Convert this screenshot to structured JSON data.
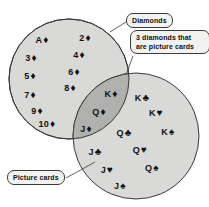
{
  "figure": {
    "type": "venn-diagram",
    "background_color": "#ffffff"
  },
  "colors": {
    "circle_fill": "#d9d9d7",
    "intersection_fill": "#b0b0ae",
    "outline": "#3a3a3a",
    "text": "#111111",
    "callout_fill": "#f2f2f0"
  },
  "sets": {
    "left": {
      "name": "Diamonds",
      "cx": 69,
      "cy": 79,
      "r": 60
    },
    "right": {
      "name": "Picture cards",
      "cx": 136,
      "cy": 136,
      "r": 63
    }
  },
  "callouts": [
    {
      "id": "diamonds",
      "text": "Diamonds",
      "x": 126,
      "y": 13,
      "leader_to_x": 113,
      "leader_to_y": 31
    },
    {
      "id": "intersection",
      "text": "3 diamonds that\nare picture cards",
      "x": 130,
      "y": 30,
      "leader_to_x": 128,
      "leader_to_y": 76
    },
    {
      "id": "picture-cards",
      "text": "Picture cards",
      "x": 7,
      "y": 170,
      "leader_to_x": 95,
      "leader_to_y": 160
    }
  ],
  "cards": {
    "left_only": [
      {
        "rank": "A",
        "suit": "♦",
        "x": 42,
        "y": 40
      },
      {
        "rank": "2",
        "suit": "♦",
        "x": 85,
        "y": 38
      },
      {
        "rank": "3",
        "suit": "♦",
        "x": 31,
        "y": 58
      },
      {
        "rank": "4",
        "suit": "♦",
        "x": 79,
        "y": 55
      },
      {
        "rank": "5",
        "suit": "♦",
        "x": 30,
        "y": 76
      },
      {
        "rank": "6",
        "suit": "♦",
        "x": 74,
        "y": 72
      },
      {
        "rank": "7",
        "suit": "♦",
        "x": 30,
        "y": 95
      },
      {
        "rank": "8",
        "suit": "♦",
        "x": 70,
        "y": 88
      },
      {
        "rank": "9",
        "suit": "♦",
        "x": 37,
        "y": 111
      },
      {
        "rank": "10",
        "suit": "♦",
        "x": 47,
        "y": 124
      }
    ],
    "intersection": [
      {
        "rank": "K",
        "suit": "♦",
        "x": 111,
        "y": 94
      },
      {
        "rank": "Q",
        "suit": "♦",
        "x": 99,
        "y": 112
      },
      {
        "rank": "J",
        "suit": "♦",
        "x": 86,
        "y": 129
      }
    ],
    "right_only": [
      {
        "rank": "K",
        "suit": "♣",
        "x": 142,
        "y": 98
      },
      {
        "rank": "K",
        "suit": "♥",
        "x": 156,
        "y": 113
      },
      {
        "rank": "Q",
        "suit": "♣",
        "x": 124,
        "y": 133
      },
      {
        "rank": "K",
        "suit": "♠",
        "x": 168,
        "y": 132
      },
      {
        "rank": "J",
        "suit": "♣",
        "x": 95,
        "y": 152
      },
      {
        "rank": "Q",
        "suit": "♥",
        "x": 140,
        "y": 150
      },
      {
        "rank": "J",
        "suit": "♥",
        "x": 107,
        "y": 170
      },
      {
        "rank": "Q",
        "suit": "♠",
        "x": 152,
        "y": 168
      },
      {
        "rank": "J",
        "suit": "♠",
        "x": 120,
        "y": 186
      }
    ]
  },
  "counts": {
    "left_only": 10,
    "intersection": 3,
    "right_only": 9
  }
}
